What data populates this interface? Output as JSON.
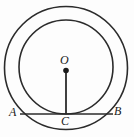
{
  "figure": {
    "kind": "geometry-diagram",
    "background_color": "#fdfdfd",
    "stroke_color": "#2b2b2b",
    "labels": {
      "center": "O",
      "chord_left_endpoint": "A",
      "chord_right_endpoint": "B",
      "tangency_point": "C"
    },
    "shapes": {
      "outer_circle": {
        "name": "outer-circle",
        "cx": 66,
        "cy": 68,
        "r": 61.5,
        "stroke_width": 1.6
      },
      "inner_circle": {
        "name": "inner-circle",
        "cx": 66,
        "cy": 67,
        "r": 47,
        "stroke_width": 1.6
      },
      "chord_AB": {
        "name": "chord-ab",
        "x1": 20,
        "y1": 114,
        "x2": 113,
        "y2": 114,
        "stroke_width": 1.4
      },
      "radius_OC": {
        "name": "radius-oc",
        "x1": 66,
        "y1": 70,
        "x2": 66,
        "y2": 114,
        "stroke_width": 1.8
      },
      "center_dot": {
        "name": "center-point-o",
        "cx": 66,
        "cy": 70.5,
        "r": 2.8
      }
    }
  }
}
